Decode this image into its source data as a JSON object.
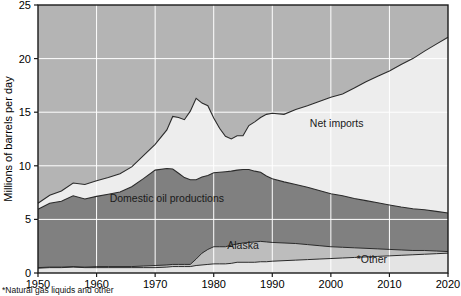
{
  "chart_data": {
    "type": "area",
    "stacked": true,
    "title": "",
    "subtitle": "",
    "xlabel": "",
    "ylabel": "Millions of barrels per day",
    "xlim": [
      1950,
      2020
    ],
    "ylim": [
      0,
      25
    ],
    "xticks": [
      1950,
      1960,
      1970,
      1980,
      1990,
      2000,
      2010,
      2020
    ],
    "xtick_labels": [
      "1950",
      "1960",
      "1970",
      "1980",
      "1990",
      "2000",
      "2010",
      "2020"
    ],
    "yticks": [
      0,
      5,
      10,
      15,
      20,
      25
    ],
    "ytick_labels": [
      "0",
      "5",
      "10",
      "15",
      "20",
      "25"
    ],
    "grid": true,
    "grid_color": "#ffffff",
    "legend_position": "inline-annotations",
    "annotations": [
      {
        "text": "Net imports",
        "x": 2001,
        "y": 13.6
      },
      {
        "text": "Domestic oil productions",
        "x": 1972,
        "y": 6.6
      },
      {
        "text": "Alaska",
        "x": 1985,
        "y": 2.2
      },
      {
        "text": "*Other",
        "x": 2007,
        "y": 0.95
      }
    ],
    "colors": {
      "net_imports": "#ededed",
      "domestic_oil_productions": "#808080",
      "alaska": "#bdbdbd",
      "other": "#e4e4e4",
      "upper_background": "#b4b4b4",
      "plot_border": "#1a1a1a",
      "gridline": "#ffffff"
    },
    "x": [
      1950,
      1952,
      1954,
      1956,
      1958,
      1960,
      1962,
      1964,
      1966,
      1968,
      1970,
      1972,
      1973,
      1974,
      1975,
      1976,
      1977,
      1978,
      1979,
      1980,
      1981,
      1982,
      1983,
      1984,
      1985,
      1986,
      1987,
      1988,
      1989,
      1990,
      1992,
      1994,
      1996,
      1998,
      2000,
      2002,
      2004,
      2006,
      2008,
      2010,
      2012,
      2014,
      2016,
      2018,
      2020
    ],
    "series": [
      {
        "name": "*Other",
        "values": [
          0.45,
          0.5,
          0.5,
          0.55,
          0.5,
          0.5,
          0.5,
          0.5,
          0.5,
          0.5,
          0.5,
          0.55,
          0.6,
          0.6,
          0.6,
          0.6,
          0.7,
          0.75,
          0.8,
          0.85,
          0.85,
          0.85,
          0.9,
          1.0,
          1.0,
          1.0,
          1.0,
          1.05,
          1.05,
          1.1,
          1.15,
          1.2,
          1.25,
          1.3,
          1.35,
          1.4,
          1.45,
          1.5,
          1.55,
          1.6,
          1.65,
          1.7,
          1.75,
          1.8,
          1.85
        ]
      },
      {
        "name": "Alaska",
        "values": [
          0.05,
          0.05,
          0.05,
          0.05,
          0.05,
          0.1,
          0.1,
          0.1,
          0.1,
          0.15,
          0.2,
          0.2,
          0.2,
          0.2,
          0.2,
          0.2,
          0.6,
          1.1,
          1.4,
          1.6,
          1.6,
          1.6,
          1.7,
          1.7,
          1.8,
          1.85,
          1.9,
          1.9,
          1.85,
          1.75,
          1.65,
          1.55,
          1.4,
          1.25,
          1.1,
          1.0,
          0.9,
          0.8,
          0.7,
          0.6,
          0.5,
          0.4,
          0.35,
          0.25,
          0.15
        ]
      },
      {
        "name": "Domestic oil productions",
        "values": [
          5.45,
          5.95,
          6.15,
          6.6,
          6.35,
          6.55,
          6.75,
          6.95,
          7.45,
          8.15,
          8.9,
          9.0,
          8.9,
          8.5,
          8.1,
          7.9,
          7.4,
          7.1,
          6.9,
          6.9,
          6.95,
          7.0,
          6.9,
          6.9,
          6.85,
          6.8,
          6.6,
          6.45,
          6.15,
          5.95,
          5.7,
          5.5,
          5.35,
          5.15,
          4.95,
          4.8,
          4.6,
          4.45,
          4.3,
          4.15,
          4.0,
          3.9,
          3.8,
          3.7,
          3.6
        ]
      },
      {
        "name": "Net imports",
        "values": [
          0.55,
          0.75,
          0.95,
          1.2,
          1.35,
          1.45,
          1.55,
          1.7,
          1.85,
          2.15,
          2.4,
          3.6,
          4.9,
          5.2,
          5.4,
          6.4,
          7.6,
          6.9,
          6.5,
          5.1,
          4.1,
          3.3,
          3.0,
          3.2,
          3.15,
          4.1,
          4.6,
          5.1,
          5.75,
          6.1,
          6.3,
          7.0,
          7.6,
          8.3,
          9.0,
          9.5,
          10.3,
          11.1,
          11.8,
          12.5,
          13.3,
          14.0,
          14.8,
          15.6,
          16.4
        ]
      }
    ],
    "total_consumption": [
      6.5,
      7.25,
      7.65,
      8.4,
      8.25,
      8.6,
      8.9,
      9.25,
      9.9,
      10.95,
      12.0,
      13.35,
      14.6,
      14.5,
      14.3,
      15.1,
      16.3,
      15.85,
      15.6,
      14.45,
      13.5,
      12.75,
      12.5,
      12.8,
      12.8,
      13.75,
      14.1,
      14.5,
      14.8,
      14.9,
      14.8,
      15.25,
      15.6,
      16.0,
      16.4,
      16.7,
      17.25,
      17.85,
      18.35,
      18.85,
      19.45,
      20.0,
      20.7,
      21.35,
      22.0
    ]
  },
  "axes": {
    "y_title": "Millions of barrels per day"
  },
  "footnote": {
    "text": "*Natural gas liquids and other"
  }
}
